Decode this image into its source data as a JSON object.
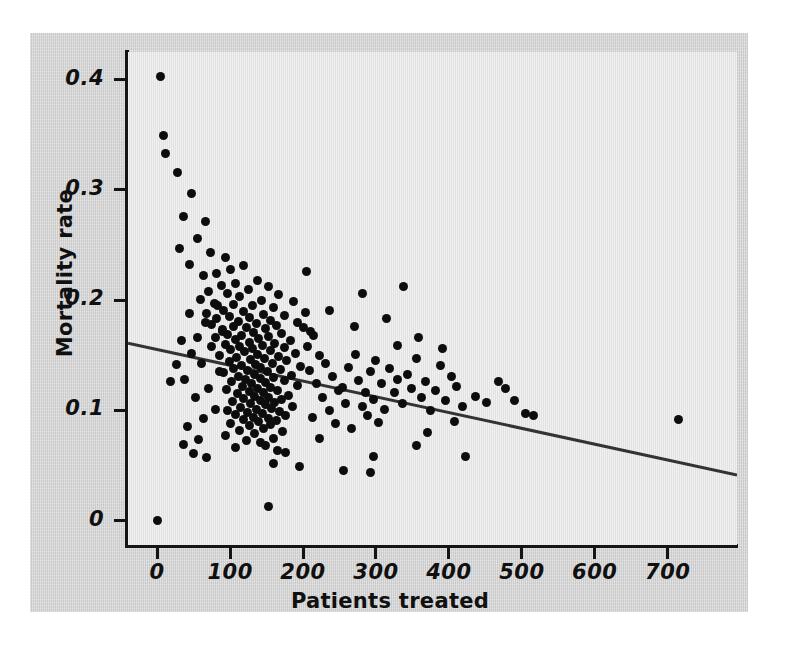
{
  "figure": {
    "background_color": "#d4d4d4",
    "plot_background_color": "#e9e9e9",
    "axis_color": "#141414",
    "marker_color": "#0d0d0d"
  },
  "chart_data": {
    "type": "scatter",
    "title": "",
    "xlabel": "Patients treated",
    "ylabel": "Mortality rate",
    "xlim": [
      -40,
      795
    ],
    "ylim": [
      -0.022,
      0.425
    ],
    "xticks": [
      0,
      100,
      200,
      300,
      400,
      500,
      600,
      700
    ],
    "xticklabels": [
      "0",
      "100",
      "200",
      "300",
      "400",
      "500",
      "600",
      "700"
    ],
    "yticks": [
      0,
      0.1,
      0.2,
      0.3,
      0.4
    ],
    "yticklabels": [
      "0",
      "0.1",
      "0.2",
      "0.3",
      "0.4"
    ],
    "grid": false,
    "legend": null,
    "annotations": [],
    "series": [
      {
        "name": "Hospitals",
        "marker": "filled-circle",
        "points": [
          [
            4,
            0.403
          ],
          [
            9,
            0.349
          ],
          [
            12,
            0.333
          ],
          [
            28,
            0.316
          ],
          [
            47,
            0.297
          ],
          [
            36,
            0.276
          ],
          [
            66,
            0.271
          ],
          [
            55,
            0.256
          ],
          [
            30,
            0.247
          ],
          [
            73,
            0.243
          ],
          [
            93,
            0.239
          ],
          [
            45,
            0.232
          ],
          [
            118,
            0.231
          ],
          [
            100,
            0.228
          ],
          [
            82,
            0.224
          ],
          [
            63,
            0.222
          ],
          [
            137,
            0.218
          ],
          [
            108,
            0.215
          ],
          [
            88,
            0.213
          ],
          [
            152,
            0.212
          ],
          [
            125,
            0.21
          ],
          [
            70,
            0.208
          ],
          [
            96,
            0.206
          ],
          [
            166,
            0.205
          ],
          [
            113,
            0.203
          ],
          [
            59,
            0.201
          ],
          [
            143,
            0.2
          ],
          [
            187,
            0.199
          ],
          [
            78,
            0.197
          ],
          [
            105,
            0.196
          ],
          [
            131,
            0.195
          ],
          [
            159,
            0.193
          ],
          [
            91,
            0.191
          ],
          [
            119,
            0.19
          ],
          [
            204,
            0.189
          ],
          [
            68,
            0.188
          ],
          [
            146,
            0.187
          ],
          [
            174,
            0.186
          ],
          [
            99,
            0.185
          ],
          [
            127,
            0.184
          ],
          [
            82,
            0.183
          ],
          [
            155,
            0.182
          ],
          [
            112,
            0.181
          ],
          [
            193,
            0.18
          ],
          [
            136,
            0.179
          ],
          [
            74,
            0.178
          ],
          [
            164,
            0.177
          ],
          [
            104,
            0.176
          ],
          [
            122,
            0.175
          ],
          [
            148,
            0.174
          ],
          [
            89,
            0.173
          ],
          [
            210,
            0.172
          ],
          [
            132,
            0.171
          ],
          [
            171,
            0.17
          ],
          [
            97,
            0.169
          ],
          [
            116,
            0.168
          ],
          [
            153,
            0.167
          ],
          [
            80,
            0.166
          ],
          [
            139,
            0.165
          ],
          [
            108,
            0.164
          ],
          [
            183,
            0.163
          ],
          [
            126,
            0.162
          ],
          [
            161,
            0.161
          ],
          [
            94,
            0.16
          ],
          [
            144,
            0.159
          ],
          [
            113,
            0.158
          ],
          [
            175,
            0.157
          ],
          [
            131,
            0.156
          ],
          [
            101,
            0.155
          ],
          [
            156,
            0.154
          ],
          [
            120,
            0.153
          ],
          [
            190,
            0.152
          ],
          [
            138,
            0.151
          ],
          [
            86,
            0.15
          ],
          [
            167,
            0.149
          ],
          [
            109,
            0.148
          ],
          [
            147,
            0.147
          ],
          [
            128,
            0.146
          ],
          [
            178,
            0.145
          ],
          [
            99,
            0.144
          ],
          [
            158,
            0.143
          ],
          [
            135,
            0.142
          ],
          [
            115,
            0.141
          ],
          [
            196,
            0.14
          ],
          [
            142,
            0.139
          ],
          [
            105,
            0.138
          ],
          [
            169,
            0.137
          ],
          [
            124,
            0.136
          ],
          [
            151,
            0.135
          ],
          [
            91,
            0.134
          ],
          [
            133,
            0.133
          ],
          [
            184,
            0.132
          ],
          [
            112,
            0.131
          ],
          [
            160,
            0.13
          ],
          [
            141,
            0.129
          ],
          [
            121,
            0.128
          ],
          [
            174,
            0.127
          ],
          [
            102,
            0.126
          ],
          [
            149,
            0.125
          ],
          [
            130,
            0.124
          ],
          [
            192,
            0.123
          ],
          [
            117,
            0.122
          ],
          [
            156,
            0.121
          ],
          [
            138,
            0.12
          ],
          [
            95,
            0.119
          ],
          [
            165,
            0.118
          ],
          [
            126,
            0.117
          ],
          [
            146,
            0.116
          ],
          [
            110,
            0.115
          ],
          [
            180,
            0.114
          ],
          [
            134,
            0.113
          ],
          [
            153,
            0.112
          ],
          [
            119,
            0.111
          ],
          [
            171,
            0.11
          ],
          [
            142,
            0.109
          ],
          [
            103,
            0.108
          ],
          [
            161,
            0.107
          ],
          [
            128,
            0.106
          ],
          [
            149,
            0.105
          ],
          [
            186,
            0.104
          ],
          [
            114,
            0.103
          ],
          [
            157,
            0.102
          ],
          [
            136,
            0.101
          ],
          [
            97,
            0.1
          ],
          [
            168,
            0.099
          ],
          [
            124,
            0.098
          ],
          [
            145,
            0.097
          ],
          [
            107,
            0.096
          ],
          [
            176,
            0.095
          ],
          [
            132,
            0.094
          ],
          [
            152,
            0.093
          ],
          [
            118,
            0.092
          ],
          [
            163,
            0.091
          ],
          [
            139,
            0.09
          ],
          [
            100,
            0.088
          ],
          [
            155,
            0.087
          ],
          [
            127,
            0.086
          ],
          [
            146,
            0.084
          ],
          [
            113,
            0.082
          ],
          [
            172,
            0.081
          ],
          [
            134,
            0.079
          ],
          [
            93,
            0.077
          ],
          [
            159,
            0.075
          ],
          [
            122,
            0.073
          ],
          [
            142,
            0.071
          ],
          [
            148,
            0.068
          ],
          [
            108,
            0.066
          ],
          [
            165,
            0.064
          ],
          [
            57,
            0.074
          ],
          [
            41,
            0.085
          ],
          [
            64,
            0.093
          ],
          [
            80,
            0.101
          ],
          [
            52,
            0.112
          ],
          [
            70,
            0.12
          ],
          [
            38,
            0.128
          ],
          [
            86,
            0.135
          ],
          [
            61,
            0.143
          ],
          [
            47,
            0.152
          ],
          [
            75,
            0.158
          ],
          [
            55,
            0.166
          ],
          [
            90,
            0.172
          ],
          [
            66,
            0.18
          ],
          [
            44,
            0.188
          ],
          [
            83,
            0.195
          ],
          [
            33,
            0.163
          ],
          [
            26,
            0.142
          ],
          [
            18,
            0.126
          ],
          [
            50,
            0.061
          ],
          [
            36,
            0.069
          ],
          [
            68,
            0.057
          ],
          [
            152,
            0.013
          ],
          [
            1,
            0.0
          ],
          [
            200,
            0.175
          ],
          [
            214,
            0.168
          ],
          [
            206,
            0.158
          ],
          [
            222,
            0.15
          ],
          [
            231,
            0.143
          ],
          [
            209,
            0.136
          ],
          [
            240,
            0.131
          ],
          [
            218,
            0.124
          ],
          [
            249,
            0.118
          ],
          [
            227,
            0.112
          ],
          [
            258,
            0.106
          ],
          [
            236,
            0.1
          ],
          [
            213,
            0.094
          ],
          [
            245,
            0.088
          ],
          [
            267,
            0.084
          ],
          [
            254,
            0.121
          ],
          [
            263,
            0.139
          ],
          [
            276,
            0.127
          ],
          [
            272,
            0.151
          ],
          [
            285,
            0.116
          ],
          [
            281,
            0.104
          ],
          [
            293,
            0.135
          ],
          [
            289,
            0.095
          ],
          [
            300,
            0.145
          ],
          [
            297,
            0.11
          ],
          [
            308,
            0.124
          ],
          [
            312,
            0.101
          ],
          [
            304,
            0.089
          ],
          [
            318,
            0.138
          ],
          [
            325,
            0.116
          ],
          [
            330,
            0.128
          ],
          [
            336,
            0.106
          ],
          [
            343,
            0.133
          ],
          [
            349,
            0.12
          ],
          [
            355,
            0.147
          ],
          [
            362,
            0.112
          ],
          [
            368,
            0.126
          ],
          [
            375,
            0.1
          ],
          [
            382,
            0.118
          ],
          [
            389,
            0.141
          ],
          [
            396,
            0.109
          ],
          [
            403,
            0.131
          ],
          [
            410,
            0.122
          ],
          [
            418,
            0.104
          ],
          [
            205,
            0.226
          ],
          [
            282,
            0.206
          ],
          [
            338,
            0.212
          ],
          [
            236,
            0.191
          ],
          [
            315,
            0.183
          ],
          [
            270,
            0.176
          ],
          [
            358,
            0.166
          ],
          [
            330,
            0.159
          ],
          [
            391,
            0.156
          ],
          [
            297,
            0.058
          ],
          [
            356,
            0.068
          ],
          [
            423,
            0.058
          ],
          [
            370,
            0.08
          ],
          [
            407,
            0.09
          ],
          [
            437,
            0.113
          ],
          [
            452,
            0.107
          ],
          [
            468,
            0.126
          ],
          [
            478,
            0.12
          ],
          [
            490,
            0.109
          ],
          [
            505,
            0.097
          ],
          [
            516,
            0.095
          ],
          [
            715,
            0.092
          ],
          [
            255,
            0.046
          ],
          [
            292,
            0.044
          ],
          [
            195,
            0.049
          ],
          [
            160,
            0.052
          ],
          [
            176,
            0.062
          ],
          [
            222,
            0.075
          ]
        ]
      }
    ],
    "fit_line": {
      "type": "linear-regression",
      "x_start": -40,
      "y_start": 0.161,
      "x_end": 795,
      "y_end": 0.0415,
      "color": "#333333"
    }
  }
}
